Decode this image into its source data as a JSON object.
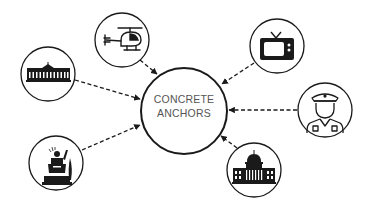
{
  "diagram": {
    "title": "CONCRETE ANCHORS",
    "center": {
      "label_line1": "CONCRETE",
      "label_line2": "ANCHORS"
    },
    "nodes": [
      {
        "id": "helicopter",
        "icon": "helicopter-icon"
      },
      {
        "id": "television",
        "icon": "tv-icon"
      },
      {
        "id": "white-house",
        "icon": "white-house-icon"
      },
      {
        "id": "police-officer",
        "icon": "police-officer-icon"
      },
      {
        "id": "politician-speech",
        "icon": "politician-podium-icon"
      },
      {
        "id": "capitol",
        "icon": "capitol-building-icon"
      }
    ],
    "edge_style": "dashed arrow pointing to center",
    "colors": {
      "stroke": "#1a1a1a",
      "text": "#555555",
      "background": "#ffffff"
    }
  }
}
